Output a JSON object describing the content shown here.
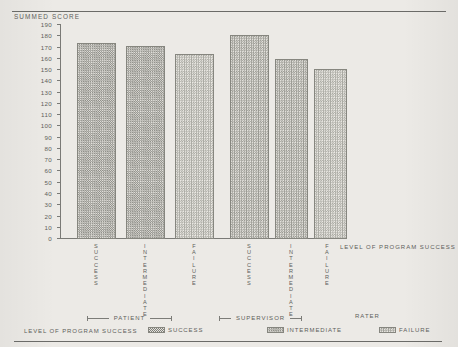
{
  "chart_data": {
    "type": "bar",
    "title": "",
    "ylabel": "SUMMED SCORE",
    "xlabel": "LEVEL OF PROGRAM SUCCESS",
    "ylim": [
      0,
      190
    ],
    "ytick_step": 10,
    "yticks": [
      190,
      180,
      170,
      160,
      150,
      140,
      130,
      120,
      110,
      100,
      90,
      80,
      70,
      60,
      50,
      40,
      30,
      20,
      10,
      0
    ],
    "grid": false,
    "legend_position": "bottom",
    "legend_title": "LEVEL OF PROGRAM SUCCESS",
    "categories": [
      "SUCCESS",
      "INTERMEDIATE",
      "FAILURE"
    ],
    "groups": [
      {
        "name": "PATIENT",
        "values": [
          174,
          171,
          164
        ]
      },
      {
        "name": "SUPERVISOR",
        "values": [
          181,
          160,
          151
        ]
      }
    ],
    "group_axis_label": "RATER",
    "bars": [
      {
        "group": "PATIENT",
        "category": "SUCCESS",
        "value": 174
      },
      {
        "group": "PATIENT",
        "category": "INTERMEDIATE",
        "value": 171
      },
      {
        "group": "PATIENT",
        "category": "FAILURE",
        "value": 164
      },
      {
        "group": "SUPERVISOR",
        "category": "SUCCESS",
        "value": 181
      },
      {
        "group": "SUPERVISOR",
        "category": "INTERMEDIATE",
        "value": 160
      },
      {
        "group": "SUPERVISOR",
        "category": "FAILURE",
        "value": 151
      }
    ]
  },
  "axes": {
    "y_title": "SUMMED SCORE",
    "x_title": "LEVEL OF PROGRAM SUCCESS"
  },
  "tick_labels": {
    "t190": "190",
    "t180": "180",
    "t170": "170",
    "t160": "160",
    "t150": "150",
    "t140": "140",
    "t130": "130",
    "t120": "120",
    "t110": "110",
    "t100": "100",
    "t90": "90",
    "t80": "80",
    "t70": "70",
    "t60": "60",
    "t50": "50",
    "t40": "40",
    "t30": "30",
    "t20": "20",
    "t10": "10",
    "t0": "0"
  },
  "bar_labels": {
    "b1": "SUCCESS",
    "b2": "INTERMEDIATE",
    "b3": "FAILURE",
    "b4": "SUCCESS",
    "b5": "INTERMEDIATE",
    "b6": "FAILURE"
  },
  "groups": {
    "patient": "PATIENT",
    "supervisor": "SUPERVISOR",
    "rater": "RATER"
  },
  "legend": {
    "title": "LEVEL OF PROGRAM SUCCESS",
    "success": "SUCCESS",
    "intermediate": "INTERMEDIATE",
    "failure": "FAILURE"
  }
}
